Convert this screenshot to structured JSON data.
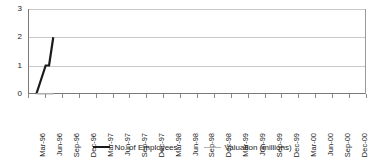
{
  "chart_data": {
    "type": "line",
    "title": "",
    "subtitle": "",
    "xlabel": "",
    "ylabel": "",
    "ylim": [
      0,
      3
    ],
    "yticks": [
      0,
      1,
      2,
      3
    ],
    "ytick_labels": [
      "0",
      "1",
      "2",
      "3"
    ],
    "grid": true,
    "grid_axis": "y",
    "legend_position": "bottom",
    "categories": [
      "Mar-96",
      "Jun-96",
      "Sep-96",
      "Dec-96",
      "Mar-97",
      "Jun-97",
      "Sep-97",
      "Dec-97",
      "Mar-98",
      "Jun-98",
      "Sep-98",
      "Dec-98",
      "Mar-99",
      "Jun-99",
      "Sep-99",
      "Dec-99",
      "Mar-00",
      "Jun-00",
      "Sep-00",
      "Dec-00"
    ],
    "series": [
      {
        "name": "No. of Employees",
        "color": "#1a1a1a",
        "width": 2.2,
        "points": [
          {
            "x": 0.0,
            "y": 0
          },
          {
            "x": 0.55,
            "y": 1
          },
          {
            "x": 0.75,
            "y": 1
          },
          {
            "x": 1.0,
            "y": 2
          }
        ],
        "values": [
          0,
          2,
          null,
          null,
          null,
          null,
          null,
          null,
          null,
          null,
          null,
          null,
          null,
          null,
          null,
          null,
          null,
          null,
          null,
          null
        ]
      },
      {
        "name": "Valuation (millions)",
        "color": "#b0b0b0",
        "width": 1.6,
        "points": [
          {
            "x": 0.0,
            "y": 0
          },
          {
            "x": 1.0,
            "y": 0
          }
        ],
        "values": [
          0,
          0,
          null,
          null,
          null,
          null,
          null,
          null,
          null,
          null,
          null,
          null,
          null,
          null,
          null,
          null,
          null,
          null,
          null,
          null
        ]
      }
    ]
  },
  "legend": {
    "entries": [
      {
        "label": "No. of Employees",
        "swatch": "employees-line-swatch"
      },
      {
        "label": "Valuation (millions)",
        "swatch": "valuation-line-swatch"
      }
    ]
  },
  "colors": {
    "employees": "#1a1a1a",
    "valuation": "#b0b0b0",
    "gridline": "#c8c8c8",
    "axis": "#7a7a7a",
    "plot_border": "#9a9a9a",
    "background": "#ffffff"
  }
}
